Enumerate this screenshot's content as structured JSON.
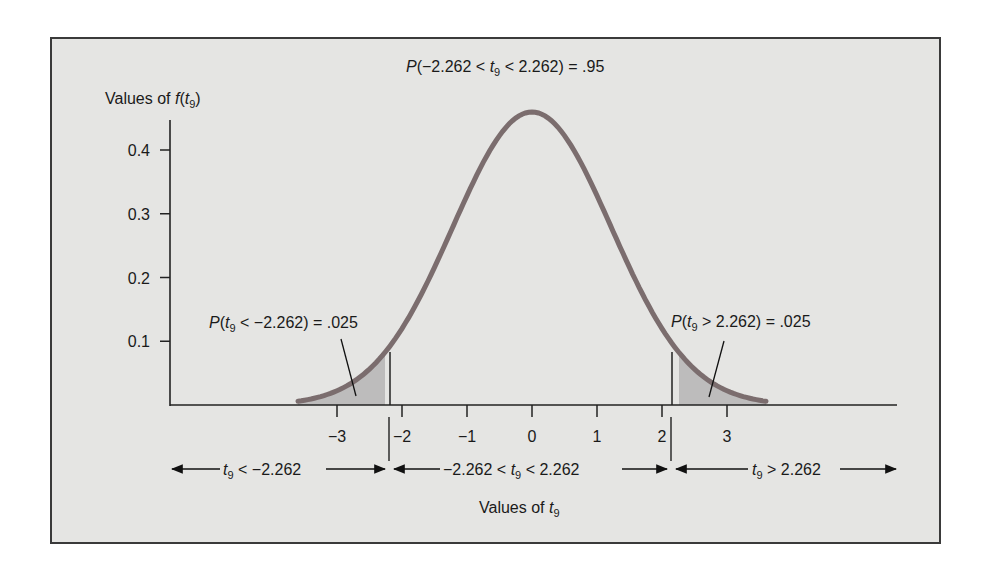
{
  "chart_data": {
    "type": "line",
    "title": "P(−2.262 < t9 < 2.262) = .95",
    "xlabel": "Values of t9",
    "ylabel": "Values of f(t9)",
    "x_ticks": [
      -3,
      -2,
      -1,
      0,
      1,
      2,
      3
    ],
    "x_tick_labels": [
      "−3",
      "−2",
      "−1",
      "0",
      "1",
      "2",
      "3"
    ],
    "y_ticks": [
      0.1,
      0.2,
      0.3,
      0.4
    ],
    "y_tick_labels": [
      "0.1",
      "0.2",
      "0.3",
      "0.4"
    ],
    "ylim": [
      0,
      0.45
    ],
    "xlim": [
      -3.6,
      3.6
    ],
    "grid": false,
    "distribution": "Student t, 9 degrees of freedom",
    "critical_value": 2.262,
    "series": [
      {
        "name": "f(t9)",
        "x": [
          -3.6,
          -3.0,
          -2.262,
          -2.0,
          -1.0,
          0.0,
          1.0,
          2.0,
          2.262,
          3.0,
          3.6
        ],
        "values": [
          0.008,
          0.016,
          0.04,
          0.056,
          0.23,
          0.388,
          0.23,
          0.056,
          0.04,
          0.016,
          0.008
        ]
      }
    ],
    "shaded_regions": [
      {
        "from": -3.6,
        "to": -2.262,
        "label": "P(t9 < −2.262) = .025",
        "probability": 0.025
      },
      {
        "from": 2.262,
        "to": 3.6,
        "label": "P(t9 > 2.262) = .025",
        "probability": 0.025
      }
    ],
    "annotations": [
      "P(−2.262 < t9 < 2.262) = .95",
      "P(t9 < −2.262) = .025",
      "P(t9 > 2.262) = .025",
      "t9 < −2.262",
      "−2.262 < t9 < 2.262",
      "t9 > 2.262"
    ]
  },
  "labels": {
    "y_axis": {
      "prefix": "Values of ",
      "func": "f",
      "open": "(",
      "var": "t",
      "sub": "9",
      "close": ")"
    },
    "x_axis": {
      "prefix": "Values of ",
      "var": "t",
      "sub": "9"
    },
    "top": {
      "p": "P",
      "open": "(−2.262 < ",
      "var": "t",
      "sub": "9",
      "rest": " < 2.262) = .95"
    },
    "left_tail": {
      "p": "P",
      "open": "(",
      "var": "t",
      "sub": "9",
      "rest": " < −2.262) = .025"
    },
    "right_tail": {
      "p": "P",
      "open": "(",
      "var": "t",
      "sub": "9",
      "rest": " > 2.262) = .025"
    },
    "region_left": {
      "var": "t",
      "sub": "9",
      "rest": " < −2.262"
    },
    "region_mid": {
      "pre": "−2.262 < ",
      "var": "t",
      "sub": "9",
      "rest": " < 2.262"
    },
    "region_right": {
      "var": "t",
      "sub": "9",
      "rest": " > 2.262"
    }
  },
  "colors": {
    "curve": "#7b6d6e",
    "shade": "#bdbcbc",
    "background": "#e5e5e3",
    "axis": "#222222"
  }
}
